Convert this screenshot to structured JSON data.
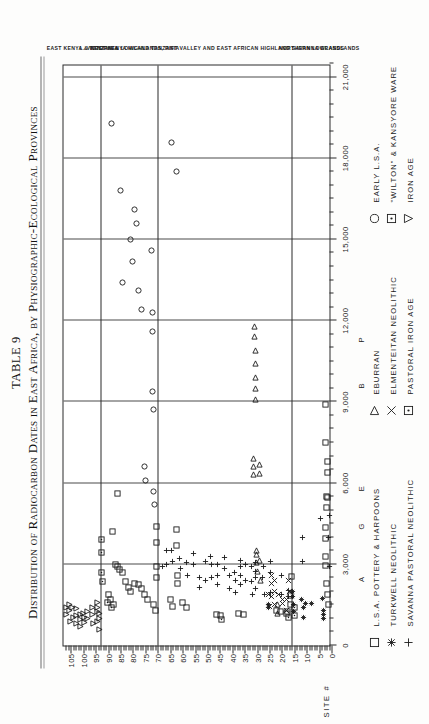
{
  "figure": {
    "table_label": "TABLE 9",
    "title": "Distribution of Radiocarbon Dates in East Africa, by Physiographic-Ecological Provinces"
  },
  "axes": {
    "site_axis_title": "SITE #",
    "site_ticks": [
      0,
      5,
      10,
      15,
      20,
      25,
      30,
      35,
      40,
      45,
      50,
      55,
      60,
      65,
      70,
      75,
      80,
      85,
      90,
      95,
      100,
      105
    ],
    "date_ticks": [
      {
        "value": 0,
        "label": "0"
      },
      {
        "value": 3000,
        "label": "3,000"
      },
      {
        "value": 6000,
        "label": "6,000"
      },
      {
        "value": 9000,
        "label": "9,000"
      },
      {
        "value": 12000,
        "label": "12,000"
      },
      {
        "value": 15000,
        "label": "15,000"
      },
      {
        "value": 18000,
        "label": "18,000"
      },
      {
        "value": 21000,
        "label": "21,000"
      }
    ],
    "period_marks": [
      {
        "letter": "A",
        "value": 2450
      },
      {
        "letter": "G",
        "value": 4400
      },
      {
        "letter": "E",
        "value": 5800
      },
      {
        "letter": "B",
        "value": 9600
      },
      {
        "letter": "P",
        "value": 11300
      }
    ]
  },
  "provinces": [
    {
      "name": "NORTHERN LOWLANDS",
      "from": 0,
      "to": 16
    },
    {
      "name": "WEST KENYA HIGHLANDS, RIFT VALLEY AND EAST AFRICAN HIGHLAND SAVANNA GRASSLANDS",
      "from": 16,
      "to": 70
    },
    {
      "name": "L. VICTORIA & LOWLAND TANZANIA",
      "from": 70,
      "to": 93
    },
    {
      "name": "EAST KENYA & TANZANIA",
      "from": 93,
      "to": 108
    }
  ],
  "legend": {
    "columns": [
      {
        "x": 0,
        "entries": [
          {
            "symbol": "square",
            "label": "L.S.A. POTTERY & HARPOONS"
          },
          {
            "symbol": "asterisk",
            "label": "TURKWELL NEOLITHIC"
          },
          {
            "symbol": "plus",
            "label": "SAVANNA PASTORAL NEOLITHIC"
          }
        ]
      },
      {
        "x": 232,
        "entries": [
          {
            "symbol": "triangle-up",
            "label": "EBURRAN"
          },
          {
            "symbol": "x-cross",
            "label": "ELMENTEITAN NEOLITHIC"
          },
          {
            "symbol": "dot-square",
            "label": "PASTORAL IRON AGE"
          }
        ]
      },
      {
        "x": 424,
        "entries": [
          {
            "symbol": "circle",
            "label": "EARLY L.S.A."
          },
          {
            "symbol": "dot-square",
            "label": "\"WILTON\" & KANSYORE WARE"
          },
          {
            "symbol": "triangle-right",
            "label": "IRON AGE"
          }
        ]
      }
    ]
  },
  "chart_data": {
    "type": "scatter",
    "title": "Distribution of Radiocarbon Dates in East Africa, by Physiographic-Ecological Provinces",
    "xlabel": "",
    "ylabel": "SITE #",
    "xlim": [
      0,
      21500
    ],
    "ylim": [
      0,
      108
    ],
    "grid": "vertical gridlines every 3,000 years; horizontal province dividers",
    "legend_position": "below plot, three columns",
    "note": "x = radiocarbon date (years BP), y = site number; printed sideways on page",
    "series": [
      {
        "name": "L.S.A. POTTERY & HARPOONS",
        "symbol": "square",
        "points": [
          [
            1500,
            1.2
          ],
          [
            1900,
            1.6
          ],
          [
            2300,
            2.0
          ],
          [
            2950,
            2.4
          ],
          [
            3300,
            2.4
          ],
          [
            3950,
            2.4
          ],
          [
            4350,
            2.4
          ],
          [
            5100,
            2.0
          ],
          [
            5500,
            2.0
          ],
          [
            5450,
            1.7
          ],
          [
            6400,
            1.5
          ],
          [
            6800,
            1.5
          ],
          [
            7500,
            2.3
          ],
          [
            8900,
            2.4
          ],
          [
            1500,
            16.5
          ],
          [
            1850,
            16.5
          ],
          [
            2550,
            16.3
          ],
          [
            1200,
            18.0
          ],
          [
            1250,
            20.4
          ],
          [
            1300,
            22.0
          ],
          [
            1150,
            35.3
          ],
          [
            1200,
            37.5
          ],
          [
            1100,
            44.8
          ],
          [
            1150,
            46.5
          ],
          [
            1400,
            58.5
          ],
          [
            1600,
            60.2
          ],
          [
            2300,
            62.0
          ],
          [
            2600,
            62.0
          ],
          [
            3700,
            62.3
          ],
          [
            4300,
            62.3
          ],
          [
            1450,
            64.0
          ],
          [
            1700,
            65.0
          ],
          [
            2500,
            70.5
          ],
          [
            2900,
            70.5
          ],
          [
            3800,
            70.6
          ],
          [
            4400,
            70.6
          ],
          [
            1300,
            71.0
          ],
          [
            1500,
            71.8
          ],
          [
            1700,
            74.0
          ],
          [
            1900,
            75.5
          ],
          [
            2100,
            76.5
          ],
          [
            2250,
            77.8
          ],
          [
            2300,
            79.5
          ],
          [
            2000,
            81.0
          ],
          [
            2150,
            82.0
          ],
          [
            2350,
            83.0
          ],
          [
            2700,
            84.2
          ],
          [
            2800,
            85.4
          ],
          [
            2900,
            86.2
          ],
          [
            3000,
            87.0
          ],
          [
            1500,
            88.0
          ],
          [
            1700,
            89.0
          ],
          [
            1900,
            90.0
          ],
          [
            5600,
            86.3
          ],
          [
            4200,
            88.3
          ]
        ]
      },
      {
        "name": "TURKWELL NEOLITHIC",
        "symbol": "asterisk",
        "points": [
          [
            1000,
            3.1
          ],
          [
            1150,
            3.1
          ],
          [
            1300,
            3.1
          ],
          [
            1750,
            3.6
          ],
          [
            1550,
            8.2
          ],
          [
            1050,
            11.4
          ],
          [
            1400,
            11.4
          ],
          [
            1700,
            11.9
          ],
          [
            1550,
            10.6
          ],
          [
            1250,
            15.4
          ],
          [
            1500,
            15.4
          ],
          [
            1800,
            15.6
          ],
          [
            2000,
            15.6
          ],
          [
            1400,
            25.2
          ],
          [
            1500,
            25.4
          ]
        ]
      },
      {
        "name": "SAVANNA PASTORAL NEOLITHIC",
        "symbol": "plus",
        "points": [
          [
            2900,
            1.0
          ],
          [
            4000,
            1.3
          ],
          [
            4800,
            1.0
          ],
          [
            4700,
            4.6
          ],
          [
            3100,
            11.6
          ],
          [
            4000,
            11.6
          ],
          [
            1800,
            17.2
          ],
          [
            2050,
            17.2
          ],
          [
            1900,
            20.0
          ],
          [
            2600,
            20.0
          ],
          [
            1950,
            24.6
          ],
          [
            2700,
            24.6
          ],
          [
            3100,
            24.6
          ],
          [
            1900,
            27.0
          ],
          [
            2500,
            27.8
          ],
          [
            2900,
            27.5
          ],
          [
            2100,
            30.5
          ],
          [
            2500,
            30.5
          ],
          [
            2750,
            30.5
          ],
          [
            3050,
            30.6
          ],
          [
            1900,
            32.0
          ],
          [
            2350,
            32.2
          ],
          [
            2900,
            32.4
          ],
          [
            2400,
            34.5
          ],
          [
            3000,
            34.8
          ],
          [
            2250,
            36.6
          ],
          [
            2600,
            36.6
          ],
          [
            2900,
            36.7
          ],
          [
            3150,
            36.7
          ],
          [
            1950,
            38.8
          ],
          [
            2400,
            38.8
          ],
          [
            2700,
            39.0
          ],
          [
            2100,
            41.2
          ],
          [
            2600,
            41.2
          ],
          [
            2850,
            43.0
          ],
          [
            3250,
            43.1
          ],
          [
            2250,
            45.8
          ],
          [
            2600,
            45.8
          ],
          [
            3000,
            45.9
          ],
          [
            2500,
            48.4
          ],
          [
            3000,
            48.5
          ],
          [
            3300,
            48.6
          ],
          [
            2400,
            50.6
          ],
          [
            3100,
            50.8
          ],
          [
            2150,
            53.0
          ],
          [
            2500,
            53.2
          ],
          [
            3000,
            55.6
          ],
          [
            3400,
            55.7
          ],
          [
            2600,
            58.2
          ],
          [
            3050,
            58.3
          ],
          [
            2850,
            61.0
          ],
          [
            3200,
            61.2
          ],
          [
            3100,
            64.2
          ],
          [
            3500,
            64.4
          ],
          [
            3000,
            66.5
          ],
          [
            3500,
            66.6
          ],
          [
            2900,
            68.0
          ]
        ]
      },
      {
        "name": "EBURRAN",
        "symbol": "triangle-up",
        "points": [
          [
            2400,
            28.6
          ],
          [
            3150,
            28.9
          ],
          [
            2750,
            30.0
          ],
          [
            3050,
            30.2
          ],
          [
            3350,
            30.2
          ],
          [
            3500,
            30.2
          ],
          [
            6350,
            29.0
          ],
          [
            6700,
            29.2
          ],
          [
            6300,
            31.4
          ],
          [
            6600,
            31.5
          ],
          [
            6900,
            31.5
          ],
          [
            1200,
            21.6
          ],
          [
            1500,
            21.6
          ],
          [
            9100,
            30.5
          ],
          [
            9500,
            30.6
          ],
          [
            9900,
            30.6
          ],
          [
            10400,
            30.8
          ],
          [
            10900,
            30.8
          ],
          [
            11400,
            30.9
          ],
          [
            11800,
            30.9
          ]
        ]
      },
      {
        "name": "ELMENTEITAN NEOLITHIC",
        "symbol": "x-cross",
        "points": [
          [
            1550,
            19.6
          ],
          [
            1700,
            19.6
          ],
          [
            1900,
            21.2
          ],
          [
            1500,
            22.8
          ],
          [
            2000,
            22.9
          ],
          [
            2400,
            22.9
          ],
          [
            1800,
            24.0
          ],
          [
            2300,
            24.2
          ],
          [
            2600,
            24.2
          ],
          [
            1450,
            25.0
          ],
          [
            1900,
            25.2
          ],
          [
            2000,
            17.0
          ],
          [
            2400,
            17.2
          ],
          [
            1300,
            18.2
          ],
          [
            1700,
            18.3
          ]
        ]
      },
      {
        "name": "PASTORAL IRON AGE",
        "symbol": "dot-square",
        "points": [
          [
            1050,
            17.5
          ],
          [
            1250,
            17.6
          ],
          [
            1100,
            14.8
          ],
          [
            1400,
            14.9
          ],
          [
            950,
            44.5
          ]
        ]
      },
      {
        "name": "EARLY L.S.A.",
        "symbol": "circle",
        "points": [
          [
            5200,
            71.5
          ],
          [
            5700,
            71.8
          ],
          [
            8700,
            71.9
          ],
          [
            9400,
            72.0
          ],
          [
            11600,
            72.0
          ],
          [
            12300,
            72.2
          ],
          [
            6100,
            75.0
          ],
          [
            6600,
            75.2
          ],
          [
            14600,
            72.5
          ],
          [
            12400,
            76.5
          ],
          [
            13100,
            77.8
          ],
          [
            14200,
            80.0
          ],
          [
            15000,
            81.2
          ],
          [
            15600,
            78.5
          ],
          [
            16100,
            79.5
          ],
          [
            13400,
            84.2
          ],
          [
            16800,
            85.0
          ],
          [
            19300,
            88.5
          ],
          [
            17500,
            62.3
          ],
          [
            18600,
            64.5
          ]
        ]
      },
      {
        "name": "\"WILTON\" & KANSYORE WARE",
        "symbol": "dot-square",
        "points": [
          [
            2350,
            92.4
          ],
          [
            2700,
            92.5
          ],
          [
            3450,
            92.6
          ],
          [
            3900,
            92.6
          ],
          [
            1400,
            88.5
          ],
          [
            1600,
            90.2
          ]
        ]
      },
      {
        "name": "IRON AGE",
        "symbol": "triangle-right",
        "points": [
          [
            900,
            94.5
          ],
          [
            1250,
            94.4
          ],
          [
            1400,
            94.3
          ],
          [
            1600,
            94.3
          ],
          [
            800,
            95.8
          ],
          [
            1150,
            96.2
          ],
          [
            1400,
            96.5
          ],
          [
            1000,
            98.2
          ],
          [
            1250,
            98.5
          ],
          [
            850,
            99.4
          ],
          [
            1050,
            99.6
          ],
          [
            1200,
            99.8
          ],
          [
            700,
            101.0
          ],
          [
            950,
            101.2
          ],
          [
            1150,
            101.3
          ],
          [
            800,
            102.6
          ],
          [
            1100,
            102.8
          ],
          [
            1350,
            102.9
          ],
          [
            1050,
            104.0
          ],
          [
            1400,
            104.2
          ],
          [
            900,
            105.3
          ],
          [
            1300,
            105.5
          ],
          [
            1500,
            105.6
          ],
          [
            1150,
            106.6
          ],
          [
            1400,
            106.8
          ],
          [
            600,
            93.4
          ],
          [
            1000,
            93.3
          ],
          [
            1200,
            93.3
          ]
        ]
      }
    ]
  }
}
